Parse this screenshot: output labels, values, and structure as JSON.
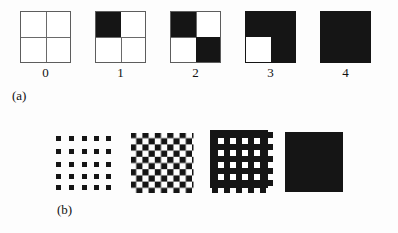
{
  "figure": {
    "background_color": "#fdfdfd",
    "ink_color": "#151515",
    "line_color": "#6a6a6a",
    "panels": [
      {
        "id": "a",
        "caption": "(a)",
        "description": "Row of five 2-by-2 quadrant squares showing an increasing number of filled quadrants, labelled 0 through 4.",
        "items": [
          {
            "label": "0",
            "filled_count": 0,
            "quadrants": {
              "top_left": false,
              "top_right": false,
              "bottom_left": false,
              "bottom_right": false
            },
            "show_grid_lines": true
          },
          {
            "label": "1",
            "filled_count": 1,
            "quadrants": {
              "top_left": true,
              "top_right": false,
              "bottom_left": false,
              "bottom_right": false
            },
            "show_grid_lines": true
          },
          {
            "label": "2",
            "filled_count": 2,
            "quadrants": {
              "top_left": true,
              "top_right": false,
              "bottom_left": false,
              "bottom_right": true
            },
            "show_grid_lines": true
          },
          {
            "label": "3",
            "filled_count": 3,
            "quadrants": {
              "top_left": true,
              "top_right": true,
              "bottom_left": false,
              "bottom_right": true
            },
            "show_grid_lines": false
          },
          {
            "label": "4",
            "filled_count": 4,
            "quadrants": {
              "top_left": true,
              "top_right": true,
              "bottom_left": true,
              "bottom_right": true
            },
            "show_grid_lines": false
          }
        ]
      },
      {
        "id": "b",
        "caption": "(b)",
        "description": "Row of four square textures showing progressive dilation of a regular dot grid until the square becomes solid black.",
        "items": [
          {
            "label": "",
            "texture": "dot-grid",
            "grid": 5,
            "coverage": "sparse"
          },
          {
            "label": "",
            "texture": "checkerboard",
            "grid": 9,
            "coverage": "half"
          },
          {
            "label": "",
            "texture": "mesh-holes",
            "grid": 4,
            "coverage": "dense"
          },
          {
            "label": "",
            "texture": "solid",
            "grid": 1,
            "coverage": "full"
          }
        ]
      }
    ]
  }
}
